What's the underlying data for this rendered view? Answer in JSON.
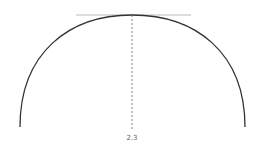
{
  "diagram": {
    "type": "semicircle-arc-with-tangent",
    "colors": {
      "arc": "#333333",
      "tangent": "#bbbbbb",
      "dashed_line": "#666666",
      "label": "#666666"
    },
    "arc": {
      "start": [
        20,
        127
      ],
      "apex": [
        132,
        15
      ],
      "end": [
        245,
        127
      ]
    },
    "tangent_line": {
      "x1": 76,
      "x2": 191,
      "y": 15
    },
    "dashed_line": {
      "x": 132,
      "y1": 15,
      "y2": 131
    },
    "label": {
      "text": "2.3",
      "x": 132,
      "y": 140
    }
  }
}
